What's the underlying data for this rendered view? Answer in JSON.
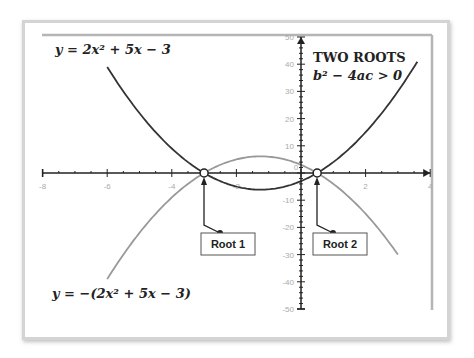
{
  "chart_data": {
    "type": "line",
    "title": "TWO ROOTS",
    "subtitle": "b² − 4ac > 0",
    "xlabel": "",
    "ylabel": "",
    "xlim": [
      -8,
      4
    ],
    "ylim": [
      -50,
      50
    ],
    "x_ticks": [
      -8,
      -6,
      -4,
      -2,
      0,
      2,
      4
    ],
    "y_ticks": [
      -50,
      -40,
      -30,
      -20,
      -10,
      0,
      10,
      20,
      30,
      40,
      50
    ],
    "grid": false,
    "series": [
      {
        "name": "y = 2x² + 5x − 3",
        "color": "#333333",
        "x": [
          -6,
          -5,
          -4,
          -3,
          -2,
          -1.25,
          -1,
          0,
          0.5,
          1,
          2,
          3,
          3.6
        ],
        "values": [
          39,
          22,
          9,
          0,
          -5,
          -6.125,
          -6,
          -3,
          0,
          4,
          15,
          30,
          40.9
        ]
      },
      {
        "name": "y = −(2x² + 5x − 3)",
        "color": "#999999",
        "x": [
          -6,
          -5,
          -4,
          -3,
          -2,
          -1.25,
          -1,
          0,
          0.5,
          1,
          2,
          3
        ],
        "values": [
          -39,
          -22,
          -9,
          0,
          5,
          6.125,
          6,
          3,
          0,
          -4,
          -15,
          -30
        ]
      }
    ],
    "annotations": [
      {
        "label": "Root 1",
        "x": -3,
        "y": 0
      },
      {
        "label": "Root 2",
        "x": 0.5,
        "y": 0
      },
      {
        "label": "y = 2x² + 5x − 3",
        "position": "top-left"
      },
      {
        "label": "y = −(2x² + 5x − 3)",
        "position": "bottom-left"
      }
    ]
  },
  "labels": {
    "eq_top": "y = 2x² + 5x − 3",
    "eq_bottom": "y = −(2x² + 5x − 3)",
    "title": "TWO ROOTS",
    "subtitle": "b² − 4ac > 0",
    "root1": "Root 1",
    "root2": "Root 2"
  },
  "colors": {
    "upward_curve": "#333333",
    "downward_curve": "#999999",
    "axis": "#222222",
    "tick_label": "#aaaaaa",
    "frame": "#d4d4d4"
  }
}
